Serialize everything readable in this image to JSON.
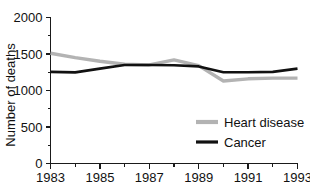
{
  "chart_data": {
    "type": "line",
    "title": "",
    "xlabel": "",
    "ylabel": "Number of deaths",
    "x": [
      1983,
      1984,
      1985,
      1986,
      1987,
      1988,
      1989,
      1990,
      1991,
      1992,
      1993
    ],
    "xlim": [
      1983,
      1993
    ],
    "ylim": [
      0,
      2000
    ],
    "grid": false,
    "legend_position": "lower-right",
    "x_tick_labels": [
      "1983",
      "1985",
      "1987",
      "1989",
      "1991",
      "1993"
    ],
    "x_tick_values": [
      1983,
      1985,
      1987,
      1989,
      1991,
      1993
    ],
    "x_minor_tick_values": [
      1984,
      1986,
      1988,
      1990,
      1992
    ],
    "y_tick_labels": [
      "0",
      "500",
      "1000",
      "1500",
      "2000"
    ],
    "y_tick_values": [
      0,
      500,
      1000,
      1500,
      2000
    ],
    "y_minor_tick_values": [
      250,
      750,
      1250,
      1750
    ],
    "series": [
      {
        "name": "Heart disease",
        "color": "#b3b3b3",
        "values": [
          1510,
          1450,
          1400,
          1360,
          1350,
          1420,
          1340,
          1130,
          1160,
          1170,
          1170
        ]
      },
      {
        "name": "Cancer",
        "color": "#111111",
        "values": [
          1255,
          1248,
          1300,
          1350,
          1350,
          1345,
          1330,
          1250,
          1250,
          1255,
          1300
        ]
      }
    ]
  },
  "legend": {
    "entries": [
      {
        "label": "Heart disease",
        "color": "#b3b3b3"
      },
      {
        "label": "Cancer",
        "color": "#111111"
      }
    ]
  },
  "axes": {
    "y_axis_label": "Number of deaths"
  }
}
